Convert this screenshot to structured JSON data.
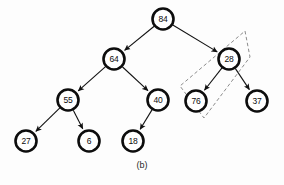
{
  "figure": {
    "caption": "(b)",
    "type": "binary-tree-diagram",
    "background_color": "#fdfdfd",
    "node_fill": "#ffffff",
    "node_stroke": "#0d0d0d",
    "edge_color": "#111111",
    "highlight_color": "#8c8c8c"
  },
  "nodes": [
    {
      "id": "n84",
      "label": "84",
      "cx": 163,
      "cy": 19,
      "r": 10.5
    },
    {
      "id": "n64",
      "label": "64",
      "cx": 114,
      "cy": 59,
      "r": 10.5
    },
    {
      "id": "n28",
      "label": "28",
      "cx": 229,
      "cy": 59,
      "r": 10.5
    },
    {
      "id": "n55",
      "label": "55",
      "cx": 68,
      "cy": 100,
      "r": 10.5
    },
    {
      "id": "n40",
      "label": "40",
      "cx": 158,
      "cy": 100,
      "r": 10.5
    },
    {
      "id": "n76",
      "label": "76",
      "cx": 196,
      "cy": 101,
      "r": 10.5
    },
    {
      "id": "n37",
      "label": "37",
      "cx": 257,
      "cy": 101,
      "r": 10.5
    },
    {
      "id": "n27",
      "label": "27",
      "cx": 26,
      "cy": 141,
      "r": 10.5
    },
    {
      "id": "n6",
      "label": "6",
      "cx": 89,
      "cy": 141,
      "r": 10.5
    },
    {
      "id": "n18",
      "label": "18",
      "cx": 133,
      "cy": 141,
      "r": 10.5
    }
  ],
  "edges": [
    {
      "id": "e84-64",
      "from": "n84",
      "to": "n64"
    },
    {
      "id": "e84-28",
      "from": "n84",
      "to": "n28"
    },
    {
      "id": "e64-55",
      "from": "n64",
      "to": "n55"
    },
    {
      "id": "e64-40",
      "from": "n64",
      "to": "n40"
    },
    {
      "id": "e55-27",
      "from": "n55",
      "to": "n27"
    },
    {
      "id": "e55-6",
      "from": "n55",
      "to": "n6"
    },
    {
      "id": "e40-18",
      "from": "n40",
      "to": "n18"
    },
    {
      "id": "e28-76",
      "from": "n28",
      "to": "n76"
    },
    {
      "id": "e28-37",
      "from": "n28",
      "to": "n37"
    }
  ],
  "highlight": {
    "label": "selected-subpath",
    "points": "245,31 250,57 204,118 180,86",
    "encloses": [
      "28",
      "76"
    ]
  }
}
